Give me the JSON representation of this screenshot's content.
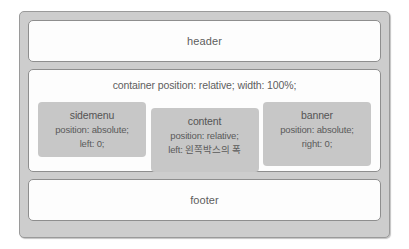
{
  "diagram": {
    "name": "css-position-layout-diagram",
    "colors": {
      "frame": "#cdcdcd",
      "panel": "#fdfdfd",
      "box": "#c7c7c7",
      "text": "#5a5a5a",
      "border": "#8e8e8e"
    },
    "header": {
      "label": "header"
    },
    "container": {
      "caption": "container position: relative; width: 100%;",
      "boxes": [
        {
          "id": "sidemenu",
          "title": "sidemenu",
          "lines": [
            "position: absolute;",
            "left: 0;"
          ]
        },
        {
          "id": "content",
          "title": "content",
          "lines": [
            "position: relative;",
            "left: 왼쪽박스의 폭"
          ]
        },
        {
          "id": "banner",
          "title": "banner",
          "lines": [
            "position: absolute;",
            "right: 0;"
          ]
        }
      ]
    },
    "footer": {
      "label": "footer"
    }
  }
}
